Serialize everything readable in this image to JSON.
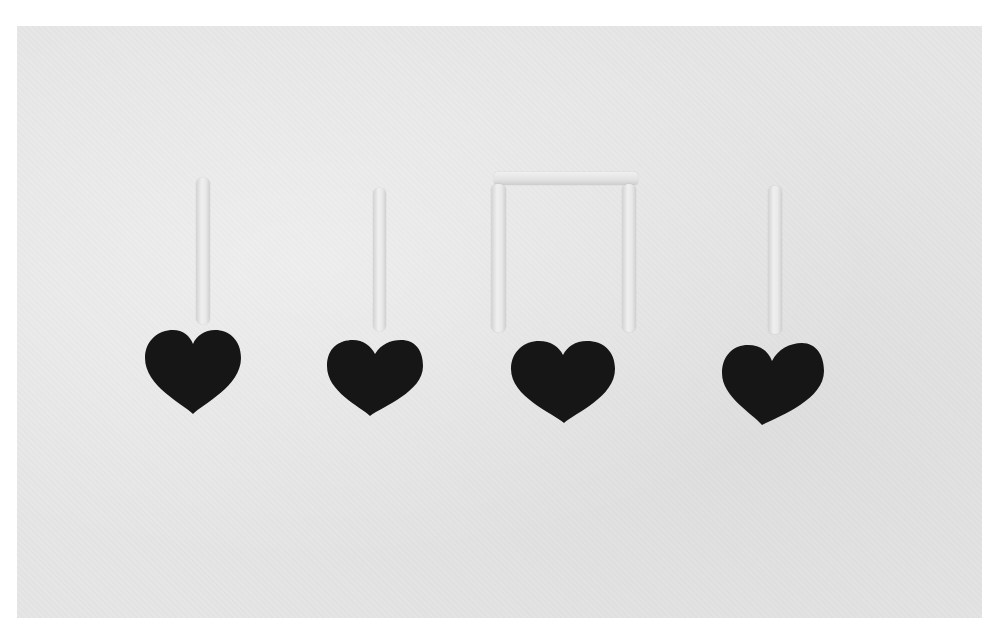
{
  "scene": {
    "description": "Four dark felt hearts with light popsicle-stick stems arranged as musical notes on a light gray fabric background",
    "background_color": "#e6e6e6",
    "heart_color": "#161616",
    "stick_color": "#e8e8e8",
    "notes": [
      {
        "type": "quarter-note"
      },
      {
        "type": "quarter-note"
      },
      {
        "type": "beamed-eighth-pair"
      },
      {
        "type": "quarter-note"
      }
    ]
  }
}
